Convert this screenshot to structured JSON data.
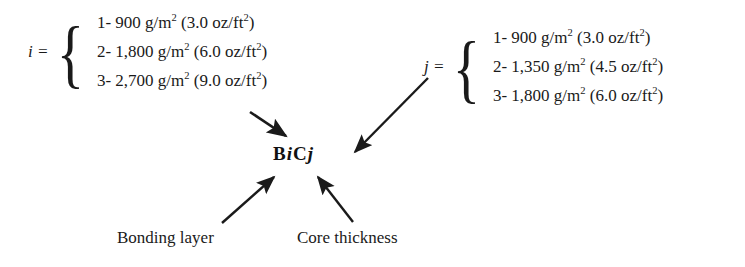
{
  "diagram": {
    "center_label": {
      "b": "B",
      "i": "i",
      "c": "C",
      "j": "j",
      "full": "B i C j"
    },
    "groups": [
      {
        "id": "bonding-layer",
        "variable": "i",
        "equals": "i =",
        "brace": "{",
        "rows": [
          {
            "index": "1-",
            "metric": "900 g/m",
            "metric_sup": "2",
            "imperial": "(3.0 oz/ft",
            "imperial_sup": "2",
            "imperial_end": ")"
          },
          {
            "index": "2-",
            "metric": "1,800 g/m",
            "metric_sup": "2",
            "imperial": "(6.0 oz/ft",
            "imperial_sup": "2",
            "imperial_end": ")"
          },
          {
            "index": "3-",
            "metric": "2,700 g/m",
            "metric_sup": "2",
            "imperial": "(9.0 oz/ft",
            "imperial_sup": "2",
            "imperial_end": ")"
          }
        ]
      },
      {
        "id": "core-thickness",
        "variable": "j",
        "equals": "j =",
        "brace": "{",
        "rows": [
          {
            "index": "1-",
            "metric": "900 g/m",
            "metric_sup": "2",
            "imperial": "(3.0 oz/ft",
            "imperial_sup": "2",
            "imperial_end": ")"
          },
          {
            "index": "2-",
            "metric": "1,350 g/m",
            "metric_sup": "2",
            "imperial": "(4.5 oz/ft",
            "imperial_sup": "2",
            "imperial_end": ")"
          },
          {
            "index": "3-",
            "metric": "1,800 g/m",
            "metric_sup": "2",
            "imperial": "(6.0 oz/ft",
            "imperial_sup": "2",
            "imperial_end": ")"
          }
        ]
      }
    ],
    "captions": {
      "bonding": "Bonding layer",
      "core": "Core thickness"
    },
    "colors": {
      "ink": "#1a1a1a",
      "background": "#ffffff"
    }
  }
}
